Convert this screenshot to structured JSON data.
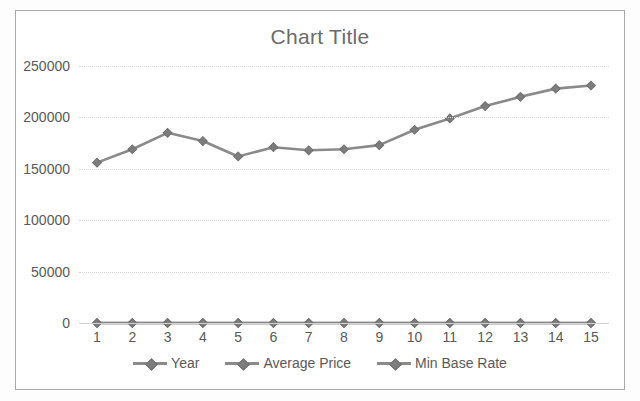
{
  "chart_data": {
    "type": "line",
    "title": "Chart Title",
    "xlabel": "",
    "ylabel": "",
    "categories": [
      "1",
      "2",
      "3",
      "4",
      "5",
      "6",
      "7",
      "8",
      "9",
      "10",
      "11",
      "12",
      "13",
      "14",
      "15"
    ],
    "yticks": [
      "0",
      "50000",
      "100000",
      "150000",
      "200000",
      "250000"
    ],
    "ytick_values": [
      0,
      50000,
      100000,
      150000,
      200000,
      250000
    ],
    "ylim": [
      0,
      250000
    ],
    "grid": true,
    "legend_position": "bottom",
    "series": [
      {
        "name": "Year",
        "color": "#8a8a8a",
        "values": [
          0,
          0,
          0,
          0,
          0,
          0,
          0,
          0,
          0,
          0,
          0,
          0,
          0,
          0,
          0
        ]
      },
      {
        "name": "Average Price",
        "color": "#8a8a8a",
        "values": [
          156000,
          169000,
          185000,
          177000,
          162000,
          171000,
          168000,
          169000,
          173000,
          188000,
          199000,
          211000,
          220000,
          228000,
          231000
        ]
      },
      {
        "name": "Min Base Rate",
        "color": "#8a8a8a",
        "values": [
          0,
          0,
          0,
          0,
          0,
          0,
          0,
          0,
          0,
          0,
          0,
          0,
          0,
          0,
          0
        ]
      }
    ]
  },
  "colors": {
    "line": "#8a8a8a",
    "marker": "#7d7d7d",
    "text": "#595959",
    "title": "#6b6b6b",
    "grid": "#d6d6d6",
    "frame": "#a9a9a9",
    "background": "#ffffff"
  }
}
